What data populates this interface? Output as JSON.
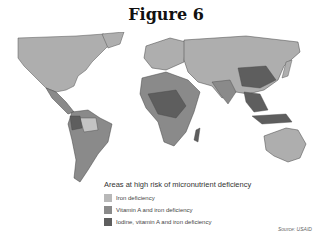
{
  "figure": {
    "title": "Figure 6"
  },
  "map": {
    "description": "World map of areas at high risk of micronutrient deficiency",
    "base_land_color": "#aeaeae",
    "ocean_color": "#ffffff"
  },
  "legend": {
    "title": "Areas at high risk of micronutrient deficiency",
    "items": [
      {
        "label": "Iron deficiency",
        "color": "#b8b8b8"
      },
      {
        "label": "Vitamin A and iron deficiency",
        "color": "#8a8a8a"
      },
      {
        "label": "Iodine, vitamin A and iron deficiency",
        "color": "#5e5e5e"
      }
    ]
  },
  "source": {
    "text": "Source: USAID"
  }
}
